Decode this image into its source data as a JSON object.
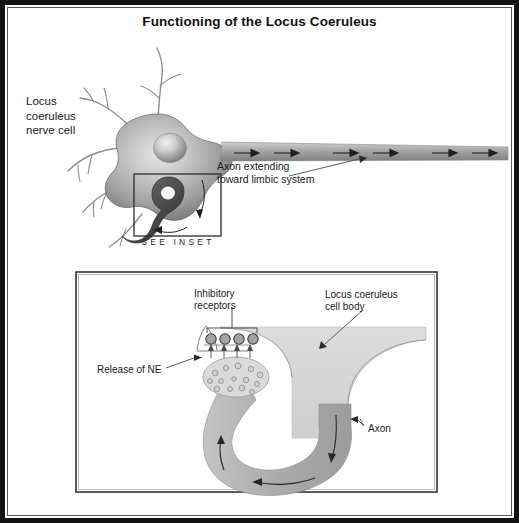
{
  "figure": {
    "title": "Functioning of the Locus Coeruleus",
    "background_color": "#ffffff",
    "frame_color": "#141414",
    "ink_color": "#1a1a1a"
  },
  "upper_diagram": {
    "name": "locus-coeruleus-neuron-overview",
    "labels": {
      "nerve_cell": "Locus\ncoeruleus\nnerve cell",
      "axon_extending": "Axon extending\ntoward limbic system",
      "see_inset": "SEE INSET"
    },
    "axon_flow_arrow_count": 6,
    "dendrite_count": 6,
    "soma_fill": "#9a9a9a",
    "nucleus_fill": "#b9b9b9",
    "axon_fill": "#a8a8a8"
  },
  "inset_diagram": {
    "name": "synaptic-terminal-inset",
    "labels": {
      "inhibitory_receptors": "Inhibitory\nreceptors",
      "cell_body": "Locus coeruleus\ncell body",
      "release_of_ne": "Release of NE",
      "axon": "Axon"
    },
    "receptor_count": 4,
    "vesicle_count": 14,
    "release_arrow_count": 4,
    "flow_arrow_count": 3,
    "cell_body_fill": "#d2d2d2",
    "axon_fill": "#b0b0b0",
    "bouton_fill": "#d9d9d9",
    "receptor_fill": "#9b9b9b",
    "frame_color": "#333333"
  }
}
